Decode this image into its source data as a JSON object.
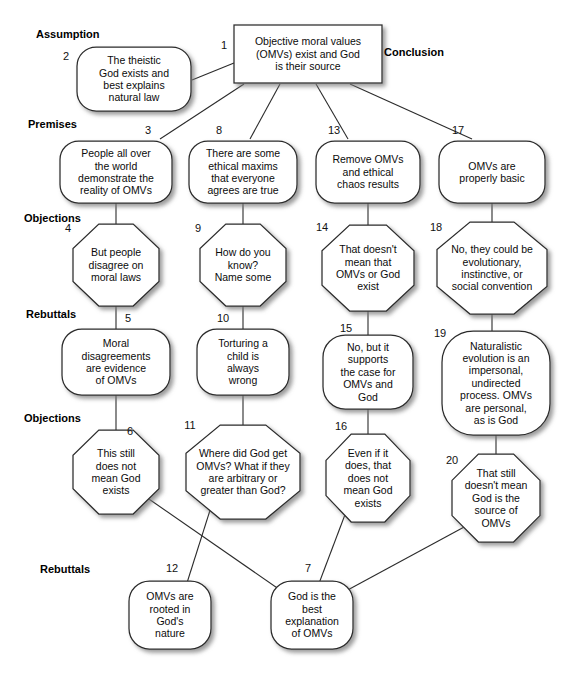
{
  "diagram": {
    "colors": {
      "stroke": "#2b2b2b",
      "fill": "#ffffff",
      "text": "#0b0b0b"
    },
    "section_labels": [
      {
        "id": "assumption",
        "text": "Assumption",
        "x": 36,
        "y": 38
      },
      {
        "id": "conclusion",
        "text": "Conclusion",
        "x": 384,
        "y": 56
      },
      {
        "id": "premises",
        "text": "Premises",
        "x": 28,
        "y": 128
      },
      {
        "id": "objections-1",
        "text": "Objections",
        "x": 24,
        "y": 222
      },
      {
        "id": "rebuttals-1",
        "text": "Rebuttals",
        "x": 26,
        "y": 318
      },
      {
        "id": "objections-2",
        "text": "Objections",
        "x": 24,
        "y": 422
      },
      {
        "id": "rebuttals-2",
        "text": "Rebuttals",
        "x": 40,
        "y": 573
      }
    ],
    "nodes": [
      {
        "num": "1",
        "shape": "rect",
        "text": [
          "Objective moral values",
          "(OMVs) exist and God",
          "is their source"
        ],
        "cx": 308,
        "cy": 54,
        "w": 148,
        "h": 58,
        "numx": 224,
        "numy": 49
      },
      {
        "num": "2",
        "shape": "rounded",
        "text": [
          "The theistic",
          "God exists and",
          "best explains",
          "natural law"
        ],
        "cx": 134,
        "cy": 79,
        "w": 114,
        "h": 64,
        "numx": 66,
        "numy": 60
      },
      {
        "num": "3",
        "shape": "rounded",
        "text": [
          "People all over",
          "the world",
          "demonstrate the",
          "reality of OMVs"
        ],
        "cx": 116,
        "cy": 172,
        "w": 112,
        "h": 62,
        "numx": 148,
        "numy": 134
      },
      {
        "num": "8",
        "shape": "rounded",
        "text": [
          "There are some",
          "ethical maxims",
          "that everyone",
          "agrees are true"
        ],
        "cx": 243,
        "cy": 172,
        "w": 108,
        "h": 62,
        "numx": 219,
        "numy": 134
      },
      {
        "num": "13",
        "shape": "rounded",
        "text": [
          "Remove OMVs",
          "and ethical",
          "chaos results"
        ],
        "cx": 368,
        "cy": 172,
        "w": 104,
        "h": 62,
        "numx": 334,
        "numy": 134
      },
      {
        "num": "17",
        "shape": "rounded",
        "text": [
          "OMVs are",
          "properly basic"
        ],
        "cx": 492,
        "cy": 172,
        "w": 106,
        "h": 62,
        "numx": 458,
        "numy": 134
      },
      {
        "num": "4",
        "shape": "octagon",
        "text": [
          "But people",
          "disagree on",
          "moral laws"
        ],
        "cx": 116,
        "cy": 265,
        "w": 86,
        "h": 82,
        "numx": 68,
        "numy": 232
      },
      {
        "num": "9",
        "shape": "octagon",
        "text": [
          "How do you",
          "know?",
          "Name some"
        ],
        "cx": 243,
        "cy": 265,
        "w": 86,
        "h": 82,
        "numx": 198,
        "numy": 232
      },
      {
        "num": "14",
        "shape": "octagon",
        "text": [
          "That doesn't",
          "mean that",
          "OMVs or God",
          "exist"
        ],
        "cx": 368,
        "cy": 268,
        "w": 92,
        "h": 86,
        "numx": 322,
        "numy": 231
      },
      {
        "num": "18",
        "shape": "octagon",
        "text": [
          "No, they could be",
          "evolutionary,",
          "instinctive, or",
          "social convention"
        ],
        "cx": 492,
        "cy": 268,
        "w": 110,
        "h": 92,
        "numx": 436,
        "numy": 231
      },
      {
        "num": "5",
        "shape": "rounded",
        "text": [
          "Moral",
          "disagreements",
          "are evidence",
          "of OMVs"
        ],
        "cx": 116,
        "cy": 362,
        "w": 108,
        "h": 66,
        "numx": 128,
        "numy": 322
      },
      {
        "num": "10",
        "shape": "rounded",
        "text": [
          "Torturing a",
          "child is",
          "always",
          "wrong"
        ],
        "cx": 243,
        "cy": 362,
        "w": 92,
        "h": 66,
        "numx": 223,
        "numy": 322
      },
      {
        "num": "15",
        "shape": "rounded",
        "text": [
          "No, but it",
          "supports",
          "the case for",
          "OMVs and",
          "God"
        ],
        "cx": 368,
        "cy": 372,
        "w": 90,
        "h": 74,
        "numx": 346,
        "numy": 332
      },
      {
        "num": "19",
        "shape": "rounded",
        "text": [
          "Naturalistic",
          "evolution is an",
          "impersonal,",
          "undirected",
          "process. OMVs",
          "are personal,",
          "as is God"
        ],
        "cx": 496,
        "cy": 383,
        "w": 108,
        "h": 104,
        "numx": 440,
        "numy": 337
      },
      {
        "num": "6",
        "shape": "octagon",
        "text": [
          "This still",
          "does not",
          "mean God",
          "exists"
        ],
        "cx": 116,
        "cy": 472,
        "w": 86,
        "h": 84,
        "numx": 130,
        "numy": 435
      },
      {
        "num": "11",
        "shape": "octagon",
        "text": [
          "Where did God get",
          "OMVs? What if they",
          "are arbitrary or",
          "greater than God?"
        ],
        "cx": 243,
        "cy": 472,
        "w": 114,
        "h": 94,
        "numx": 190,
        "numy": 429
      },
      {
        "num": "16",
        "shape": "octagon",
        "text": [
          "Even if it",
          "does, that",
          "does not",
          "mean God",
          "exists"
        ],
        "cx": 368,
        "cy": 478,
        "w": 84,
        "h": 88,
        "numx": 341,
        "numy": 430
      },
      {
        "num": "20",
        "shape": "octagon",
        "text": [
          "That still",
          "doesn't mean",
          "God is the",
          "source of",
          "OMVs"
        ],
        "cx": 496,
        "cy": 498,
        "w": 88,
        "h": 88,
        "numx": 452,
        "numy": 464
      },
      {
        "num": "12",
        "shape": "rounded",
        "text": [
          "OMVs are",
          "rooted in",
          "God's",
          "nature"
        ],
        "cx": 170,
        "cy": 615,
        "w": 82,
        "h": 68,
        "numx": 172,
        "numy": 572
      },
      {
        "num": "7",
        "shape": "rounded",
        "text": [
          "God is the",
          "best",
          "explanation",
          "of OMVs"
        ],
        "cx": 312,
        "cy": 615,
        "w": 82,
        "h": 68,
        "numx": 308,
        "numy": 572
      }
    ],
    "edges": [
      {
        "from": "2",
        "to": "1",
        "x1": 192,
        "y1": 80,
        "x2": 234,
        "y2": 63
      },
      {
        "from": "3",
        "to": "1",
        "x1": 160,
        "y1": 139,
        "x2": 244,
        "y2": 84
      },
      {
        "from": "8",
        "to": "1",
        "x1": 250,
        "y1": 139,
        "x2": 280,
        "y2": 84
      },
      {
        "from": "13",
        "to": "1",
        "x1": 348,
        "y1": 139,
        "x2": 316,
        "y2": 84
      },
      {
        "from": "17",
        "to": "1",
        "x1": 472,
        "y1": 139,
        "x2": 350,
        "y2": 84
      },
      {
        "from": "4",
        "to": "3",
        "x1": 116,
        "y1": 203,
        "x2": 116,
        "y2": 225
      },
      {
        "from": "9",
        "to": "8",
        "x1": 243,
        "y1": 203,
        "x2": 243,
        "y2": 225
      },
      {
        "from": "14",
        "to": "13",
        "x1": 368,
        "y1": 203,
        "x2": 368,
        "y2": 226
      },
      {
        "from": "18",
        "to": "17",
        "x1": 492,
        "y1": 203,
        "x2": 492,
        "y2": 223
      },
      {
        "from": "5",
        "to": "4",
        "x1": 116,
        "y1": 306,
        "x2": 116,
        "y2": 330
      },
      {
        "from": "10",
        "to": "9",
        "x1": 243,
        "y1": 306,
        "x2": 243,
        "y2": 330
      },
      {
        "from": "15",
        "to": "14",
        "x1": 368,
        "y1": 311,
        "x2": 368,
        "y2": 336
      },
      {
        "from": "19",
        "to": "18",
        "x1": 492,
        "y1": 314,
        "x2": 492,
        "y2": 332
      },
      {
        "from": "6",
        "to": "5",
        "x1": 116,
        "y1": 395,
        "x2": 116,
        "y2": 431
      },
      {
        "from": "11",
        "to": "10",
        "x1": 243,
        "y1": 395,
        "x2": 243,
        "y2": 426
      },
      {
        "from": "16",
        "to": "15",
        "x1": 368,
        "y1": 409,
        "x2": 368,
        "y2": 435
      },
      {
        "from": "20",
        "to": "19",
        "x1": 496,
        "y1": 435,
        "x2": 496,
        "y2": 455
      },
      {
        "from": "6",
        "to": "7",
        "x1": 146,
        "y1": 497,
        "x2": 283,
        "y2": 592
      },
      {
        "from": "11",
        "to": "12",
        "x1": 212,
        "y1": 504,
        "x2": 186,
        "y2": 586
      },
      {
        "from": "16",
        "to": "7",
        "x1": 346,
        "y1": 512,
        "x2": 318,
        "y2": 586
      },
      {
        "from": "20",
        "to": "7",
        "x1": 466,
        "y1": 526,
        "x2": 344,
        "y2": 592
      }
    ]
  }
}
